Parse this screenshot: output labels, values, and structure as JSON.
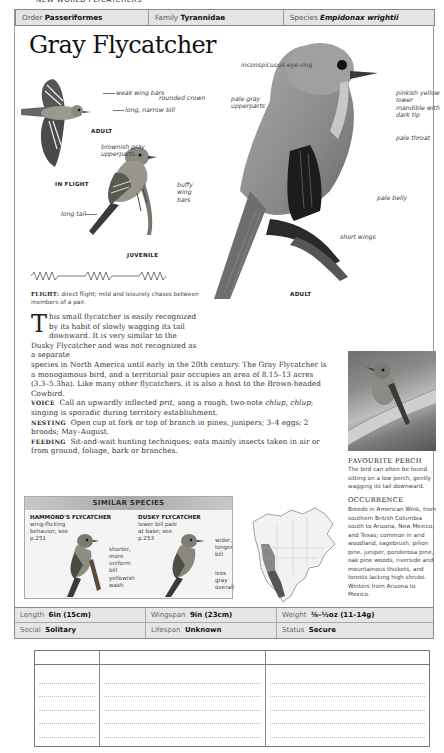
{
  "running_head": "NEW WORLD FLYCATCHERS",
  "taxonomy": {
    "order_label": "Order",
    "order": "Passeriformes",
    "family_label": "Family",
    "family": "Tyrannidae",
    "species_label": "Species",
    "species": "Empidonax wrightii"
  },
  "title": "Gray Flycatcher",
  "illustrations": {
    "flight": {
      "caption": "IN FLIGHT",
      "sub_caption": "ADULT",
      "labels": [
        "weak wing bars",
        "long, narrow bill"
      ]
    },
    "juvenile": {
      "caption": "JUVENILE",
      "labels": [
        "rounded crown",
        "brownish gray upperparts",
        "buffy wing bars",
        "long tail"
      ]
    },
    "adult": {
      "caption": "ADULT",
      "labels": [
        "inconspicuous eye-ring",
        "pale gray upperparts",
        "pinkish yellow lower mandible with dark tip",
        "pale throat",
        "pale belly",
        "short wings"
      ]
    }
  },
  "flight": {
    "label": "FLIGHT:",
    "text": "direct flight; mild and leisurely chases between members of a pair."
  },
  "description": {
    "dropcap": "T",
    "intro_narrow": "his small flycatcher is easily recognized by its habit of slowly wagging its tail downward. It is very similar to the Dusky Flycatcher and was not recognized as a separate",
    "intro_wide": "species in North America until early in the 20th century. The Gray Flycatcher is a monogamous bird, and a territorial pair occupies an area of 8.15–13 acres (3.3–5.3ha). Like many other flycatchers, it is also a host to the Brown-headed Cowbird.",
    "voice_label": "VOICE",
    "voice_text_1": "Call an upwardly inflected ",
    "voice_italic_1": "prit",
    "voice_text_2": ", song a rough, two-note ",
    "voice_italic_2": "chlup, chlup",
    "voice_text_3": "; singing is sporadic during territory establishment.",
    "nesting_label": "NESTING",
    "nesting_text": "Open cup at fork or top of branch in pines, junipers; 3–4 eggs; 2 broods; May–August.",
    "feeding_label": "FEEDING",
    "feeding_text": "Sit-and-wait hunting techniques; eats mainly insects taken in air or from ground, foliage, bark or branches."
  },
  "sidebar": {
    "perch_heading": "FAVOURITE PERCH",
    "perch_text": "The bird can often be found sitting on a low perch, gently wagging its tail downward.",
    "occurrence_heading": "OCCURRENCE",
    "occurrence_text": "Breeds in American West, from southern British Columbia south to Arizona, New Mexico, and Texas; common in arid woodland, sagebrush, piñon pine, juniper, ponderosa pine, oak pine woods, riverside and mountainous thickets, and forests lacking high shrubs. Winters from Arizona to Mexico."
  },
  "similar_species": {
    "heading": "SIMILAR SPECIES",
    "species": [
      {
        "name": "HAMMOND'S FLYCATCHER",
        "note": "wing-flicking behavior; see p.251",
        "labels": [
          "shorter, more uniform bill",
          "yellowish wash"
        ]
      },
      {
        "name": "DUSKY FLYCATCHER",
        "note": "lower bill pale at base; see p.253",
        "labels": [
          "wider, longer bill",
          "less gray overall"
        ]
      }
    ]
  },
  "stats": {
    "length_label": "Length",
    "length": "6in (15cm)",
    "wingspan_label": "Wingspan",
    "wingspan": "9in (23cm)",
    "weight_label": "Weight",
    "weight": "⅜–½oz (11–14g)",
    "social_label": "Social",
    "social": "Solitary",
    "lifespan_label": "Lifespan",
    "lifespan": "Unknown",
    "status_label": "Status",
    "status": "Secure"
  },
  "colors": {
    "header_bg": "#e4e4e4",
    "border": "#888888",
    "text": "#222222"
  }
}
